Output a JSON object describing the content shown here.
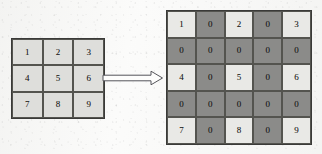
{
  "diagram": {
    "background_color": "#fbfbfa",
    "source_matrix": {
      "name": "source-matrix",
      "rows": 3,
      "cols": 3,
      "cell_color": "#dedeDB",
      "border_color": "#3a3a38",
      "values": [
        [
          "1",
          "2",
          "3"
        ],
        [
          "4",
          "5",
          "6"
        ],
        [
          "7",
          "8",
          "9"
        ]
      ]
    },
    "arrow": {
      "name": "transform-arrow",
      "direction": "right",
      "style": "outlined-block-arrow",
      "stroke_color": "#55555a",
      "fill_color": "#fdfdfc"
    },
    "dilated_matrix": {
      "name": "dilated-matrix",
      "rows": 5,
      "cols": 5,
      "value_cell_color": "#e9e9e6",
      "zero_cell_color": "#8b8b89",
      "border_color": "#3a3a38",
      "values": [
        [
          "1",
          "0",
          "2",
          "0",
          "3"
        ],
        [
          "0",
          "0",
          "0",
          "0",
          "0"
        ],
        [
          "4",
          "0",
          "5",
          "0",
          "6"
        ],
        [
          "0",
          "0",
          "0",
          "0",
          "0"
        ],
        [
          "7",
          "0",
          "8",
          "0",
          "9"
        ]
      ],
      "zero_mask": [
        [
          false,
          true,
          false,
          true,
          false
        ],
        [
          true,
          true,
          true,
          true,
          true
        ],
        [
          false,
          true,
          false,
          true,
          false
        ],
        [
          true,
          true,
          true,
          true,
          true
        ],
        [
          false,
          true,
          false,
          true,
          false
        ]
      ]
    }
  }
}
